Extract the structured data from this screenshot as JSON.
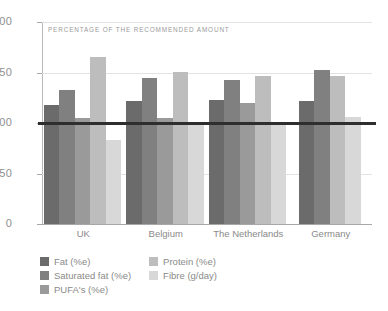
{
  "chart_data": {
    "type": "bar",
    "title": "PERCENTAGE OF THE RECOMMENDED AMOUNT",
    "xlabel": "",
    "ylabel": "",
    "ylim": [
      0,
      200
    ],
    "yticks": [
      0,
      50,
      100,
      150,
      200
    ],
    "grid": true,
    "legend_position": "bottom-left",
    "reference_line": 100,
    "categories": [
      "UK",
      "Belgium",
      "The Netherlands",
      "Germany"
    ],
    "series": [
      {
        "name": "Fat (%e)",
        "color": "#6b6b6b",
        "values": [
          118,
          122,
          123,
          122
        ]
      },
      {
        "name": "Saturated fat (%e)",
        "color": "#808080",
        "values": [
          133,
          145,
          143,
          152
        ]
      },
      {
        "name": "PUFA's (%e)",
        "color": "#9a9a9a",
        "values": [
          105,
          105,
          120,
          null
        ]
      },
      {
        "name": "Protein (%e)",
        "color": "#bdbdbd",
        "values": [
          165,
          151,
          147,
          147
        ]
      },
      {
        "name": "Fibre (g/day)",
        "color": "#d8d8d8",
        "values": [
          83,
          99,
          98,
          106
        ]
      }
    ]
  },
  "axis": {
    "tick_0": "0",
    "tick_50": "50",
    "tick_100": "100",
    "tick_150": "150",
    "tick_200": "200"
  },
  "colors": {
    "axis": "#b9b9b9",
    "grid": "#e2e2e2",
    "reference_line": "#2e2e2e",
    "text": "#8a8a8a"
  }
}
